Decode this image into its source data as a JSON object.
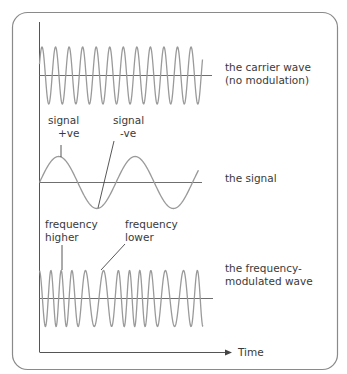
{
  "colors": {
    "frame": "#8a8a8a",
    "axis": "#555555",
    "wave": "#9a9a9a",
    "text": "#3a3a3a",
    "background": "#ffffff"
  },
  "axes": {
    "x_label": "Time"
  },
  "panels": [
    {
      "id": "carrier",
      "label_lines": [
        "the carrier wave",
        "(no modulation)"
      ]
    },
    {
      "id": "signal",
      "label_lines": [
        "the signal"
      ],
      "annotations": [
        {
          "lines": [
            "signal",
            "+ve"
          ]
        },
        {
          "lines": [
            "signal",
            "-ve"
          ]
        }
      ]
    },
    {
      "id": "fm",
      "label_lines": [
        "the frequency-",
        "modulated wave"
      ],
      "annotations": [
        {
          "lines": [
            "frequency",
            "higher"
          ]
        },
        {
          "lines": [
            "frequency",
            "lower"
          ]
        }
      ]
    }
  ]
}
